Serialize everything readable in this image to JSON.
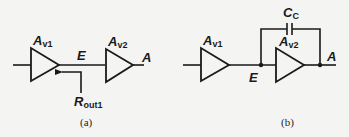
{
  "diagram": {
    "panel_a": {
      "caption": "(a)",
      "amp1": {
        "label_main": "A",
        "label_sub": "v1"
      },
      "amp2": {
        "label_main": "A",
        "label_sub": "v2"
      },
      "node_between": "E",
      "output_node": "A",
      "resistance_label_main": "R",
      "resistance_label_sub": "out1"
    },
    "panel_b": {
      "caption": "(b)",
      "amp1": {
        "label_main": "A",
        "label_sub": "v1"
      },
      "amp2": {
        "label_main": "A",
        "label_sub": "v2"
      },
      "node_between": "E",
      "output_node": "A",
      "capacitor_label_main": "C",
      "capacitor_label_sub": "C"
    },
    "colors": {
      "ink": "#1a1a1a",
      "background": "#f4f4f2"
    }
  }
}
